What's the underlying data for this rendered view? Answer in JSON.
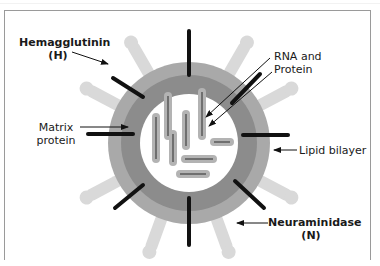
{
  "figure": {
    "type": "influenza-virus-structure",
    "colors": {
      "background": "#ffffff",
      "frame": "#9a9a9a",
      "lipid_bilayer": "#a9a9a9",
      "matrix_protein": "#8c8c8c",
      "core": "#ffffff",
      "hemagglutinin_spike": "#111111",
      "neuraminidase_spike": "#d9d9d9",
      "rna_protein_segment": "#9b9b9b",
      "rna_protein_strand": "#777777",
      "label_text": "#1a1a1a"
    }
  },
  "labels": {
    "hemagglutinin": {
      "line1": "Hemagglutinin",
      "line2": "(H)"
    },
    "rna_protein": {
      "line1": "RNA and",
      "line2": "Protein"
    },
    "matrix": {
      "line1": "Matrix",
      "line2": "protein"
    },
    "lipid": {
      "text": "Lipid bilayer"
    },
    "neuraminidase": {
      "line1": "Neuraminidase",
      "line2": "(N)"
    }
  }
}
